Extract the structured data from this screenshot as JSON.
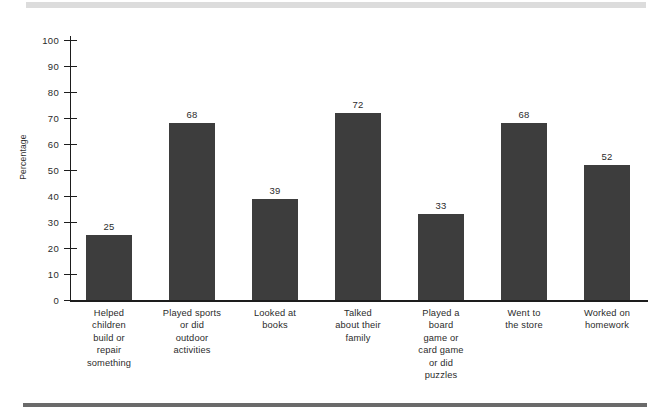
{
  "figure": {
    "background_color": "#ffffff",
    "bar_color": "#3d3d3d",
    "axis_color": "#1d1d1d",
    "top_band_color": "#dcdcdc",
    "bottom_rule_color": "#6a6a6a"
  },
  "chart_data": {
    "type": "bar",
    "title": "",
    "subtitle": "",
    "xlabel": "",
    "ylabel": "Percentage",
    "ylim": [
      0,
      100
    ],
    "yticks": [
      0,
      10,
      20,
      30,
      40,
      50,
      60,
      70,
      80,
      90,
      100
    ],
    "ytick_labels": [
      "0",
      "10",
      "20",
      "30",
      "40",
      "50",
      "60",
      "70",
      "80",
      "90",
      "100"
    ],
    "grid": false,
    "legend": false,
    "legend_position": "none",
    "categories": [
      "Helped children build or repair something",
      "Played sports or did outdoor activities",
      "Looked at books",
      "Talked about their family",
      "Played a board game or card game or did puzzles",
      "Went to the store",
      "Worked on homework"
    ],
    "category_lines": [
      [
        "Helped",
        "children",
        "build or",
        "repair",
        "something"
      ],
      [
        "Played sports",
        "or did",
        "outdoor",
        "activities"
      ],
      [
        "Looked at",
        "books"
      ],
      [
        "Talked",
        "about their",
        "family"
      ],
      [
        "Played a",
        "board",
        "game or",
        "card game",
        "or did",
        "puzzles"
      ],
      [
        "Went to",
        "the store"
      ],
      [
        "Worked on",
        "homework"
      ]
    ],
    "values": [
      25,
      68,
      39,
      72,
      33,
      68,
      52
    ],
    "value_labels": [
      "25",
      "68",
      "39",
      "72",
      "33",
      "68",
      "52"
    ]
  }
}
